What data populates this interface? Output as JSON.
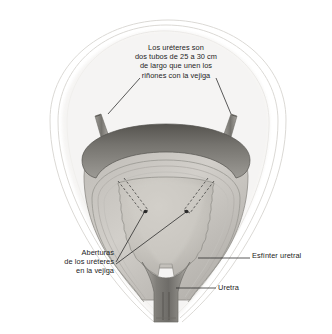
{
  "figure": {
    "type": "anatomical-illustration",
    "background_color": "#ffffff",
    "style": "grayscale pencil shaded medical illustration"
  },
  "annotations": {
    "ureters_note": "Los uréteres son\ndos tubos de 25 a 30 cm\nde largo que unen los\nriñones con la vejiga",
    "ureteral_openings": "Aberturas\nde los uréteres\nen la vejiga",
    "urethral_sphincter": "Esfínter uretral",
    "urethra": "Uretra"
  },
  "structures": [
    {
      "name": "peritoneal-envelope",
      "label": "",
      "color": "#d8d6d2"
    },
    {
      "name": "bladder-dome-muscle",
      "label": "",
      "color": "#6d6c69"
    },
    {
      "name": "bladder-wall-layers",
      "label": "",
      "color": "#a9a7a2"
    },
    {
      "name": "bladder-cavity",
      "label": "",
      "color": "#c6c2bc"
    },
    {
      "name": "left-ureter-stub",
      "label": "",
      "color": "#8e8c87"
    },
    {
      "name": "right-ureter-stub",
      "label": "",
      "color": "#8e8c87"
    },
    {
      "name": "urethra-tube",
      "label": "",
      "color": "#8a8884"
    },
    {
      "name": "ureteral-opening-left",
      "label": "",
      "color": "#2a2a2a"
    },
    {
      "name": "ureteral-opening-right",
      "label": "",
      "color": "#2a2a2a"
    }
  ],
  "colors": {
    "ink": "#1d1d1d",
    "leader_line": "#242424",
    "dark_muscle": "#6d6c69",
    "mid_tone": "#a9a7a2",
    "light_tone": "#cbc8c3",
    "faint_outline": "#d9d7d3"
  }
}
